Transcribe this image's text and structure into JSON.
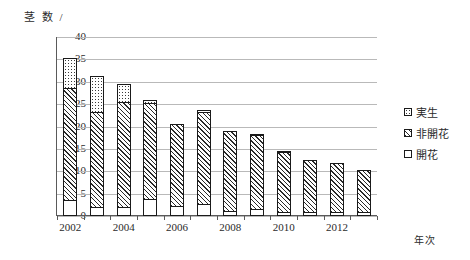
{
  "chart_data": {
    "type": "bar",
    "stacked": true,
    "title": "",
    "ylabel": "茎 数 /",
    "xlabel": "年次",
    "ylim": [
      0,
      40
    ],
    "ytick_step": 5,
    "yticks": [
      0,
      5,
      10,
      15,
      20,
      25,
      30,
      35,
      40
    ],
    "grid": true,
    "legend_position": "right",
    "categories": [
      2002,
      2003,
      2004,
      2005,
      2006,
      2007,
      2008,
      2009,
      2010,
      2011,
      2012,
      2013
    ],
    "xtick_labels": [
      "2002",
      "2004",
      "2006",
      "2008",
      "2010",
      "2012"
    ],
    "xtick_label_years": [
      2002,
      2004,
      2006,
      2008,
      2010,
      2012
    ],
    "series": [
      {
        "name": "開花",
        "pattern": "white",
        "values": [
          3.5,
          2.0,
          2.0,
          3.9,
          2.2,
          2.7,
          1.2,
          1.5,
          1.0,
          1.0,
          1.0,
          1.0
        ]
      },
      {
        "name": "非開花",
        "pattern": "hatched",
        "values": [
          25.2,
          21.2,
          23.5,
          21.4,
          18.4,
          20.6,
          17.8,
          16.5,
          13.4,
          11.5,
          10.8,
          9.2
        ]
      },
      {
        "name": "実生",
        "pattern": "dotted",
        "values": [
          6.6,
          8.1,
          3.9,
          0.7,
          0.0,
          0.5,
          0.0,
          0.4,
          0.2,
          0.0,
          0.0,
          0.0
        ]
      }
    ],
    "totals": [
      35.3,
      31.3,
      29.4,
      26.0,
      20.6,
      23.8,
      19.0,
      18.4,
      14.6,
      12.5,
      11.8,
      10.2
    ]
  },
  "legend": {
    "items": [
      {
        "label": "実生"
      },
      {
        "label": "非開花"
      },
      {
        "label": "開花"
      }
    ]
  }
}
